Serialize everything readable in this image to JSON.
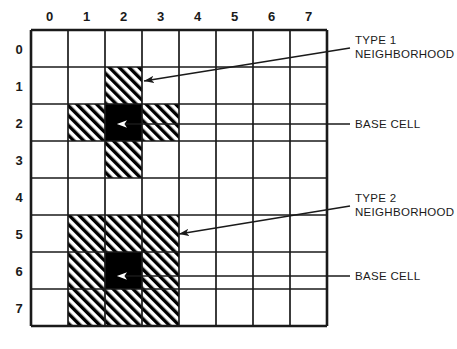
{
  "figure": {
    "background_color": "#ffffff",
    "ink_color": "#1a1a1a",
    "base_cell_color": "#000000",
    "hatch_color": "#000000"
  },
  "grid": {
    "rows": 8,
    "columns": 8,
    "origin_x": 31,
    "origin_y": 30,
    "cell_size": 37,
    "column_headers": [
      "0",
      "1",
      "2",
      "3",
      "4",
      "5",
      "6",
      "7"
    ],
    "row_headers": [
      "0",
      "1",
      "2",
      "3",
      "4",
      "5",
      "6",
      "7"
    ]
  },
  "neighborhoods": [
    {
      "id": "type-1",
      "label_line1": "TYPE 1",
      "label_line2": "NEIGHBORHOOD",
      "base_cell": {
        "row": 2,
        "col": 2
      },
      "hatched_cells": [
        {
          "row": 1,
          "col": 2
        },
        {
          "row": 2,
          "col": 1
        },
        {
          "row": 2,
          "col": 3
        },
        {
          "row": 3,
          "col": 2
        }
      ],
      "base_cell_label": "BASE CELL"
    },
    {
      "id": "type-2",
      "label_line1": "TYPE 2",
      "label_line2": "NEIGHBORHOOD",
      "base_cell": {
        "row": 6,
        "col": 2
      },
      "hatched_cells": [
        {
          "row": 5,
          "col": 1
        },
        {
          "row": 5,
          "col": 2
        },
        {
          "row": 5,
          "col": 3
        },
        {
          "row": 6,
          "col": 1
        },
        {
          "row": 6,
          "col": 3
        },
        {
          "row": 7,
          "col": 1
        },
        {
          "row": 7,
          "col": 2
        },
        {
          "row": 7,
          "col": 3
        }
      ],
      "base_cell_label": "BASE CELL"
    }
  ],
  "annotations": [
    {
      "id": "type-1-callout",
      "line1": "TYPE 1",
      "line2": "NEIGHBORHOOD",
      "text_x": 355,
      "text_y": 44,
      "arrow_from_x": 350,
      "arrow_from_y": 48,
      "arrow_to_x": 144,
      "arrow_to_y": 81,
      "arrow_style": "solid-head"
    },
    {
      "id": "type-1-base-cell-callout",
      "line1": "BASE CELL",
      "line2": "",
      "text_x": 355,
      "text_y": 128,
      "arrow_from_x": 350,
      "arrow_from_y": 124,
      "arrow_to_x": 117,
      "arrow_to_y": 124,
      "arrow_style": "open-head"
    },
    {
      "id": "type-2-callout",
      "line1": "TYPE 2",
      "line2": "NEIGHBORHOOD",
      "text_x": 355,
      "text_y": 202,
      "arrow_from_x": 350,
      "arrow_from_y": 206,
      "arrow_to_x": 179,
      "arrow_to_y": 234,
      "arrow_style": "solid-head"
    },
    {
      "id": "type-2-base-cell-callout",
      "line1": "BASE CELL",
      "line2": "",
      "text_x": 355,
      "text_y": 280,
      "arrow_from_x": 350,
      "arrow_from_y": 276,
      "arrow_to_x": 117,
      "arrow_to_y": 276,
      "arrow_style": "open-head"
    }
  ]
}
